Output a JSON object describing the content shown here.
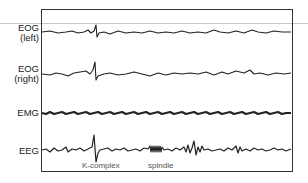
{
  "figure": {
    "channels": [
      {
        "id": "eog-left",
        "label_line1": "EOG",
        "label_line2": "(left)",
        "label_top": 23
      },
      {
        "id": "eog-right",
        "label_line1": "EOG",
        "label_line2": "(right)",
        "label_top": 64
      },
      {
        "id": "emg",
        "label_line1": "EMG",
        "label_line2": "",
        "label_top": 108
      },
      {
        "id": "eeg",
        "label_line1": "EEG",
        "label_line2": "",
        "label_top": 146
      }
    ],
    "annotations": {
      "k_complex": "K-complex",
      "spindle": "spindle"
    },
    "colors": {
      "trace": "#222222",
      "frame": "#333333",
      "guide_line": "#c8c8c8",
      "annotation": "#555555"
    }
  },
  "traces": {
    "eog_left": "42,32 50,31 58,33 66,32 72,31 78,33 84,32 88,30 91,33 94,31 96,25 97,37 99,33 104,32 110,34 118,31 126,33 134,32 142,33 150,31 158,33 166,32 174,33 182,31 190,33 198,32 206,33 214,30 220,32 228,33 236,31 244,33 252,30 258,32 266,33 274,31 282,32 291,32",
    "eog_right": "42,74 50,75 56,73 62,74 68,76 74,73 80,72 86,71 90,74 93,70 95,62 96,80 98,76 104,74 110,73 118,75 126,74 134,72 142,74 150,76 158,73 166,75 174,73 182,74 190,73 198,74 206,72 214,75 222,72 228,74 236,71 244,73 250,70 254,74 260,73 268,75 276,73 284,74 291,73",
    "emg": "42,113 46,114 50,112 54,114 58,113 62,112 66,114 70,113 74,112 78,114 82,113 86,112 90,114 94,113 98,112 102,114 106,113 110,112 114,114 118,113 122,112 126,114 130,113 134,112 138,114 142,113 146,112 150,114 154,113 158,112 162,114 166,113 170,112 174,114 178,113 182,112 186,114 190,113 194,112 198,114 202,113 206,112 210,114 214,113 218,112 222,114 226,113 230,112 234,114 238,113 242,112 246,114 250,113 254,112 258,114 262,113 266,112 270,114 274,113 278,112 282,114 286,113 291,113",
    "eeg": "42,150 46,149 50,152 54,148 58,151 62,150 66,147 68,152 72,149 76,150 80,148 84,151 88,149 92,147 94,135 96,162 98,153 100,150 104,149 108,148 112,151 116,149 120,150 124,148 128,151 132,150 136,149 140,151 144,148 148,149 150,146 151,152 152,146 153,152 154,146 155,152 156,146 157,152 158,146 159,152 160,146 161,152 162,147 164,150 168,149 172,151 176,148 180,150 184,147 186,152 188,145 190,153 192,148 194,141 196,155 198,147 200,152 202,146 204,150 208,149 212,151 216,150 220,149 224,151 228,148 232,150 236,146 238,153 240,147 242,151 246,149 250,151 254,148 258,150 262,149 266,151 270,150 274,148 278,150 282,149 286,151 291,149"
  }
}
